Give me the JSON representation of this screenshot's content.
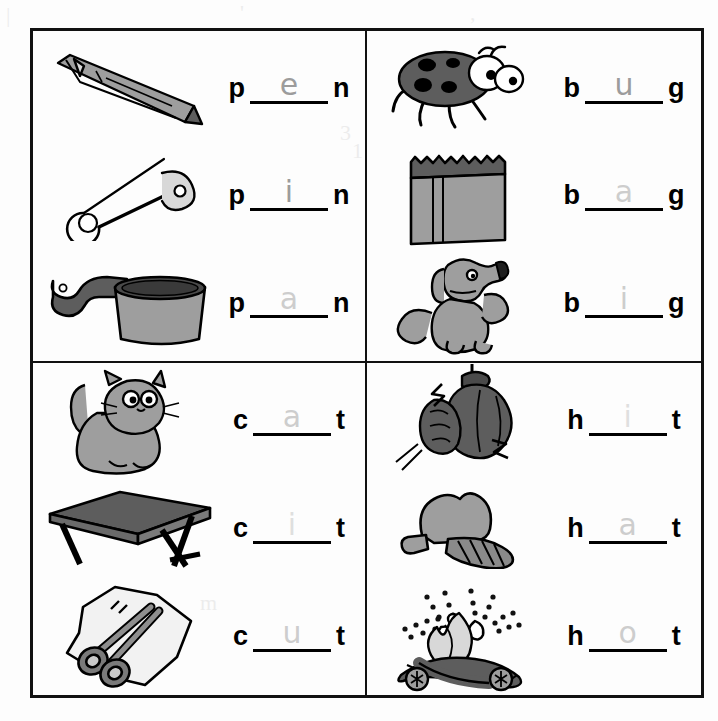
{
  "worksheet": {
    "title": "CVC Word Family Fill-in Worksheet",
    "grid": {
      "columns": 2,
      "rows": 2,
      "border_color": "#111111"
    }
  },
  "quadrants": [
    {
      "id": "quad-pen-family",
      "family": "p_n",
      "rows": [
        {
          "id": "row-pen",
          "picture": "pen-icon",
          "picture_label": "pen",
          "lead": "p",
          "tail": "n",
          "answer": "e",
          "answer_style": "normal"
        },
        {
          "id": "row-pin",
          "picture": "safety-pin-icon",
          "picture_label": "pin",
          "lead": "p",
          "tail": "n",
          "answer": "i",
          "answer_style": "normal"
        },
        {
          "id": "row-pan",
          "picture": "saucepan-icon",
          "picture_label": "pan",
          "lead": "p",
          "tail": "n",
          "answer": "a",
          "answer_style": "faint"
        }
      ]
    },
    {
      "id": "quad-bug-family",
      "family": "b_g",
      "rows": [
        {
          "id": "row-bug",
          "picture": "ladybug-icon",
          "picture_label": "bug",
          "lead": "b",
          "tail": "g",
          "answer": "u",
          "answer_style": "normal"
        },
        {
          "id": "row-bag",
          "picture": "paper-bag-icon",
          "picture_label": "bag",
          "lead": "b",
          "tail": "g",
          "answer": "a",
          "answer_style": "faint"
        },
        {
          "id": "row-big",
          "picture": "dog-icon",
          "picture_label": "dog",
          "lead": "b",
          "tail": "g",
          "answer": "i",
          "answer_style": "faint"
        }
      ]
    },
    {
      "id": "quad-cat-family",
      "family": "c_t",
      "rows": [
        {
          "id": "row-cat",
          "picture": "cat-icon",
          "picture_label": "cat",
          "lead": "c",
          "tail": "t",
          "answer": "a",
          "answer_style": "faint"
        },
        {
          "id": "row-cot",
          "picture": "cot-table-icon",
          "picture_label": "cot",
          "lead": "c",
          "tail": "t",
          "answer": "i",
          "answer_style": "vfaint"
        },
        {
          "id": "row-cut",
          "picture": "scissors-paper-icon",
          "picture_label": "cut",
          "lead": "c",
          "tail": "t",
          "answer": "u",
          "answer_style": "faint"
        }
      ]
    },
    {
      "id": "quad-hat-family",
      "family": "h_t",
      "rows": [
        {
          "id": "row-hit",
          "picture": "punching-bag-icon",
          "picture_label": "hit",
          "lead": "h",
          "tail": "t",
          "answer": "i",
          "answer_style": "vfaint"
        },
        {
          "id": "row-hat",
          "picture": "cap-icon",
          "picture_label": "hat",
          "lead": "h",
          "tail": "t",
          "answer": "a",
          "answer_style": "faint"
        },
        {
          "id": "row-hot",
          "picture": "campfire-icon",
          "picture_label": "hot",
          "lead": "h",
          "tail": "t",
          "answer": "o",
          "answer_style": "faint"
        }
      ]
    }
  ],
  "colors": {
    "ink": "#000000",
    "pencil": "#777777",
    "line_art_fill_mid": "#9e9e9e",
    "line_art_fill_dark": "#5d5d5d",
    "line_art_fill_light": "#d8d8d8",
    "paper": "#ffffff"
  }
}
